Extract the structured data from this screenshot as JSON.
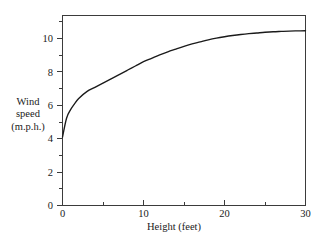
{
  "figure": {
    "name": "wind-speed-vs-height-figure",
    "background_color": "#ffffff",
    "frame_color": "#3b3b3b",
    "curve_color": "#1a1a1a"
  },
  "axis_titles": {
    "y_line1": "Wind",
    "y_line2": "speed",
    "y_line3": "(m.p.h.)",
    "x": "Height (feet)"
  },
  "chart_data": {
    "type": "line",
    "title": "",
    "subtitle": "",
    "xlabel": "Height (feet)",
    "ylabel": "Wind speed (m.p.h.)",
    "xlim": [
      0,
      30
    ],
    "ylim": [
      0,
      11.1
    ],
    "grid": false,
    "legend": false,
    "legend_position": "none",
    "x_ticks_major": [
      0,
      10,
      20,
      30
    ],
    "x_tick_labels": [
      "0",
      "10",
      "20",
      "30"
    ],
    "x_ticks_minor": [
      5,
      15,
      25
    ],
    "y_ticks_major": [
      0,
      2,
      4,
      6,
      8,
      10
    ],
    "y_tick_labels": [
      "0",
      "2",
      "4",
      "6",
      "8",
      "10"
    ],
    "y_ticks_minor": [
      1,
      3,
      5,
      7,
      9,
      11
    ],
    "series": [
      {
        "name": "wind speed profile",
        "x": [
          0,
          0.5,
          1,
          1.5,
          2,
          3,
          4,
          5,
          6,
          7,
          8,
          9,
          10,
          11,
          12,
          13,
          14,
          15,
          16,
          17,
          18,
          19,
          20,
          21,
          22,
          23,
          24,
          25,
          26,
          27,
          28,
          29,
          30
        ],
        "values": [
          4.0,
          5.1,
          5.6,
          5.95,
          6.25,
          6.65,
          6.9,
          7.15,
          7.4,
          7.65,
          7.9,
          8.15,
          8.4,
          8.6,
          8.8,
          8.98,
          9.14,
          9.3,
          9.44,
          9.56,
          9.68,
          9.78,
          9.86,
          9.93,
          9.99,
          10.04,
          10.08,
          10.12,
          10.15,
          10.17,
          10.19,
          10.2,
          10.21
        ]
      }
    ],
    "annotations": [],
    "start_point": {
      "x": 0,
      "y": 4
    },
    "end_point": {
      "x": 30,
      "y": 10.2
    }
  }
}
